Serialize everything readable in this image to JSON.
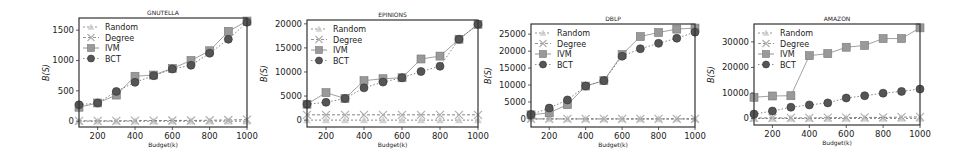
{
  "chart_data": [
    {
      "type": "line",
      "title": "GNUTELLA",
      "xlabel": "Budget(k)",
      "ylabel": "B(S)",
      "x": [
        100,
        200,
        300,
        400,
        500,
        600,
        700,
        800,
        900,
        1000
      ],
      "xticks": [
        200,
        400,
        600,
        800,
        1000
      ],
      "xlim": [
        100,
        1000
      ],
      "ylim": [
        -30,
        1700
      ],
      "yticks": [
        0,
        500,
        1000,
        1500
      ],
      "legend": "top-left",
      "series": [
        {
          "name": "Random",
          "marker": "triangle",
          "color": "#c8c8c8",
          "values": [
            0,
            0,
            0,
            0,
            0,
            0,
            0,
            0,
            0,
            0
          ]
        },
        {
          "name": "Degree",
          "marker": "x",
          "color": "#b0b0b0",
          "values": [
            5,
            5,
            5,
            8,
            10,
            12,
            12,
            15,
            20,
            25
          ]
        },
        {
          "name": "IVM",
          "marker": "square",
          "color": "#999999",
          "values": [
            230,
            300,
            430,
            740,
            760,
            870,
            1000,
            1160,
            1480,
            1650
          ]
        },
        {
          "name": "BCT",
          "marker": "circle",
          "color": "#555555",
          "values": [
            270,
            300,
            490,
            640,
            750,
            860,
            920,
            1120,
            1350,
            1630
          ]
        }
      ]
    },
    {
      "type": "line",
      "title": "EPINIONS",
      "xlabel": "Budget(k)",
      "ylabel": "B(S)",
      "x": [
        100,
        200,
        300,
        400,
        500,
        600,
        700,
        800,
        900,
        1000
      ],
      "xticks": [
        200,
        400,
        600,
        800,
        1000
      ],
      "xlim": [
        100,
        1000
      ],
      "ylim": [
        -600,
        20800
      ],
      "yticks": [
        0,
        5000,
        10000,
        15000,
        20000
      ],
      "legend": "top-left",
      "series": [
        {
          "name": "Random",
          "marker": "triangle",
          "color": "#c8c8c8",
          "values": [
            0,
            0,
            0,
            0,
            0,
            0,
            0,
            0,
            0,
            0
          ]
        },
        {
          "name": "Degree",
          "marker": "x",
          "color": "#b0b0b0",
          "values": [
            1100,
            1100,
            1100,
            1100,
            1100,
            1100,
            1100,
            1100,
            1100,
            1100
          ]
        },
        {
          "name": "IVM",
          "marker": "square",
          "color": "#999999",
          "values": [
            3300,
            5700,
            4500,
            8200,
            8600,
            8800,
            12700,
            13300,
            16800,
            19900
          ]
        },
        {
          "name": "BCT",
          "marker": "circle",
          "color": "#555555",
          "values": [
            3300,
            3700,
            4500,
            6700,
            7900,
            8800,
            10100,
            11200,
            16800,
            19900
          ]
        }
      ]
    },
    {
      "type": "line",
      "title": "DBLP",
      "xlabel": "Budget(k)",
      "ylabel": "B(S)",
      "x": [
        100,
        200,
        300,
        400,
        500,
        600,
        700,
        800,
        900,
        1000
      ],
      "xticks": [
        200,
        400,
        600,
        800,
        1000
      ],
      "xlim": [
        100,
        1000
      ],
      "ylim": [
        -1200,
        28000
      ],
      "yticks": [
        0,
        5000,
        10000,
        15000,
        20000,
        25000
      ],
      "legend": "top-left",
      "series": [
        {
          "name": "Random",
          "marker": "triangle",
          "color": "#c8c8c8",
          "values": [
            0,
            0,
            0,
            0,
            0,
            0,
            0,
            0,
            0,
            0
          ]
        },
        {
          "name": "Degree",
          "marker": "x",
          "color": "#b0b0b0",
          "values": [
            0,
            0,
            0,
            0,
            0,
            0,
            0,
            0,
            0,
            0
          ]
        },
        {
          "name": "IVM",
          "marker": "square",
          "color": "#999999",
          "values": [
            1200,
            1800,
            4200,
            9700,
            11300,
            19000,
            24300,
            25500,
            26500,
            26800
          ]
        },
        {
          "name": "BCT",
          "marker": "circle",
          "color": "#555555",
          "values": [
            1300,
            3200,
            5600,
            9700,
            11300,
            18500,
            20700,
            22300,
            23800,
            25600
          ]
        }
      ]
    },
    {
      "type": "line",
      "title": "AMAZON",
      "xlabel": "Budget(k)",
      "ylabel": "B(S)",
      "x": [
        100,
        200,
        300,
        400,
        500,
        600,
        700,
        800,
        900,
        1000
      ],
      "xticks": [
        200,
        400,
        600,
        800,
        1000
      ],
      "xlim": [
        100,
        1000
      ],
      "ylim": [
        -1000,
        37000
      ],
      "yticks": [
        0,
        10000,
        20000,
        30000
      ],
      "legend": "top-left",
      "series": [
        {
          "name": "Random",
          "marker": "triangle",
          "color": "#c8c8c8",
          "values": [
            0,
            0,
            0,
            0,
            0,
            0,
            0,
            0,
            0,
            0
          ]
        },
        {
          "name": "Degree",
          "marker": "x",
          "color": "#b0b0b0",
          "values": [
            200,
            200,
            200,
            200,
            300,
            300,
            400,
            400,
            500,
            600
          ]
        },
        {
          "name": "IVM",
          "marker": "square",
          "color": "#999999",
          "values": [
            8300,
            8800,
            8900,
            24600,
            25400,
            27900,
            28600,
            31300,
            31300,
            35500
          ]
        },
        {
          "name": "BCT",
          "marker": "circle",
          "color": "#555555",
          "values": [
            1700,
            2900,
            4400,
            5300,
            6100,
            8000,
            8900,
            9900,
            10600,
            11500
          ]
        }
      ]
    }
  ]
}
